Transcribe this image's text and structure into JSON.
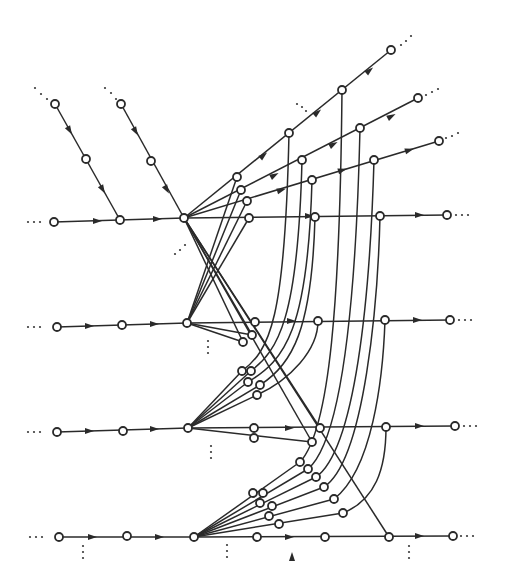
{
  "diagram": {
    "title": "",
    "stroke_color": "#2a2a2a",
    "background": "#ffffff",
    "node_radius": 4,
    "nodes": [
      [
        55,
        104
      ],
      [
        86,
        159
      ],
      [
        120,
        220
      ],
      [
        121,
        104
      ],
      [
        151,
        161
      ],
      [
        54,
        222
      ],
      [
        184,
        218
      ],
      [
        237,
        177
      ],
      [
        241,
        190
      ],
      [
        247,
        201
      ],
      [
        249,
        218
      ],
      [
        289,
        133
      ],
      [
        342,
        90
      ],
      [
        391,
        50
      ],
      [
        302,
        160
      ],
      [
        360,
        128
      ],
      [
        418,
        98
      ],
      [
        312,
        180
      ],
      [
        374,
        160
      ],
      [
        439,
        141
      ],
      [
        315,
        217
      ],
      [
        380,
        216
      ],
      [
        447,
        215
      ],
      [
        57,
        327
      ],
      [
        122,
        325
      ],
      [
        187,
        323
      ],
      [
        255,
        322
      ],
      [
        252,
        335
      ],
      [
        243,
        342
      ],
      [
        318,
        321
      ],
      [
        385,
        320
      ],
      [
        450,
        320
      ],
      [
        57,
        432
      ],
      [
        123,
        431
      ],
      [
        188,
        428
      ],
      [
        242,
        371
      ],
      [
        251,
        371
      ],
      [
        248,
        382
      ],
      [
        260,
        385
      ],
      [
        257,
        395
      ],
      [
        254,
        428
      ],
      [
        254,
        438
      ],
      [
        320,
        428
      ],
      [
        312,
        442
      ],
      [
        386,
        427
      ],
      [
        455,
        426
      ],
      [
        59,
        537
      ],
      [
        127,
        536
      ],
      [
        194,
        537
      ],
      [
        253,
        493
      ],
      [
        263,
        493
      ],
      [
        260,
        503
      ],
      [
        272,
        506
      ],
      [
        269,
        516
      ],
      [
        279,
        524
      ],
      [
        300,
        462
      ],
      [
        308,
        469
      ],
      [
        316,
        477
      ],
      [
        324,
        487
      ],
      [
        334,
        499
      ],
      [
        343,
        513
      ],
      [
        257,
        537
      ],
      [
        325,
        537
      ],
      [
        389,
        537
      ],
      [
        453,
        536
      ]
    ],
    "edges": [
      "M55,104 L120,220",
      "M121,104 L184,218",
      "M54,222 L184,218",
      "M184,218 L447,215",
      "M184,218 L391,50",
      "M184,218 L418,98",
      "M184,218 L439,141",
      "M57,327 L187,323",
      "M187,323 L450,320",
      "M187,323 L252,335",
      "M187,323 L243,342",
      "M57,432 L188,428",
      "M188,428 L455,426",
      "M188,428 L312,442",
      "M59,537 L194,537",
      "M194,537 L453,536",
      "M184,218 L320,428",
      "M184,218 L312,442",
      "M184,218 L389,537",
      "M184,218 L252,335",
      "M184,218 L243,342",
      "M187,323 L237,177",
      "M187,323 L241,190",
      "M187,323 L247,201",
      "M187,323 L249,218",
      "M188,428 L242,371",
      "M188,428 L251,371",
      "M188,428 L248,382",
      "M188,428 L260,385",
      "M188,428 L257,395",
      "M242,371 C270,350 285,320 289,133",
      "M251,371 C278,350 298,320 302,160",
      "M248,382 C285,360 308,330 312,180",
      "M260,385 C292,365 312,330 315,217",
      "M257,395 C290,380 318,350 318,321",
      "M194,537 L300,462",
      "M194,537 L308,469",
      "M194,537 L316,477",
      "M194,537 L324,487",
      "M194,537 L334,499",
      "M194,537 L343,513",
      "M300,462 C330,430 340,300 342,90",
      "M308,469 C342,440 356,300 360,128",
      "M316,477 C355,450 370,300 374,160",
      "M324,487 C365,460 378,300 380,216",
      "M334,499 C372,470 383,380 385,320",
      "M343,513 C375,500 386,470 386,427"
    ],
    "arrows": [
      [
        70,
        131,
        60
      ],
      [
        103,
        190,
        60
      ],
      [
        136,
        132,
        60
      ],
      [
        167,
        190,
        60
      ],
      [
        98,
        221,
        0
      ],
      [
        158,
        219,
        0
      ],
      [
        310,
        216,
        0
      ],
      [
        420,
        215,
        0
      ],
      [
        90,
        326,
        0
      ],
      [
        155,
        324,
        0
      ],
      [
        292,
        321,
        0
      ],
      [
        418,
        320,
        0
      ],
      [
        90,
        431,
        0
      ],
      [
        155,
        429,
        0
      ],
      [
        290,
        428,
        0
      ],
      [
        420,
        426,
        0
      ],
      [
        93,
        537,
        0
      ],
      [
        160,
        537,
        0
      ],
      [
        290,
        537,
        0
      ],
      [
        420,
        536,
        0
      ],
      [
        264,
        155,
        -40
      ],
      [
        318,
        112,
        -40
      ],
      [
        370,
        70,
        -40
      ],
      [
        275,
        175,
        -28
      ],
      [
        334,
        144,
        -28
      ],
      [
        392,
        116,
        -28
      ],
      [
        282,
        190,
        -17
      ],
      [
        343,
        170,
        -17
      ],
      [
        410,
        150,
        -17
      ],
      [
        292,
        556,
        -90
      ]
    ],
    "dots": [
      [
        35,
        88
      ],
      [
        41,
        94
      ],
      [
        47,
        99
      ],
      [
        105,
        88
      ],
      [
        111,
        93
      ],
      [
        116,
        99
      ],
      [
        175,
        254
      ],
      [
        180,
        250
      ],
      [
        185,
        245
      ],
      [
        297,
        104
      ],
      [
        302,
        107
      ],
      [
        306,
        111
      ],
      [
        401,
        45
      ],
      [
        406,
        41
      ],
      [
        411,
        36
      ],
      [
        426,
        95
      ],
      [
        432,
        92
      ],
      [
        438,
        89
      ],
      [
        446,
        138
      ],
      [
        452,
        136
      ],
      [
        458,
        133
      ],
      [
        28,
        222
      ],
      [
        34,
        222
      ],
      [
        40,
        222
      ],
      [
        456,
        215
      ],
      [
        462,
        215
      ],
      [
        468,
        215
      ],
      [
        28,
        327
      ],
      [
        34,
        327
      ],
      [
        40,
        327
      ],
      [
        459,
        320
      ],
      [
        465,
        320
      ],
      [
        471,
        320
      ],
      [
        28,
        432
      ],
      [
        34,
        432
      ],
      [
        40,
        432
      ],
      [
        464,
        426
      ],
      [
        470,
        426
      ],
      [
        476,
        426
      ],
      [
        30,
        537
      ],
      [
        36,
        537
      ],
      [
        42,
        537
      ],
      [
        461,
        536
      ],
      [
        467,
        536
      ],
      [
        473,
        536
      ],
      [
        208,
        341
      ],
      [
        208,
        347
      ],
      [
        208,
        353
      ],
      [
        211,
        446
      ],
      [
        211,
        452
      ],
      [
        211,
        458
      ],
      [
        83,
        546
      ],
      [
        83,
        552
      ],
      [
        83,
        558
      ],
      [
        227,
        545
      ],
      [
        227,
        551
      ],
      [
        227,
        557
      ],
      [
        409,
        546
      ],
      [
        409,
        552
      ],
      [
        409,
        558
      ]
    ]
  }
}
